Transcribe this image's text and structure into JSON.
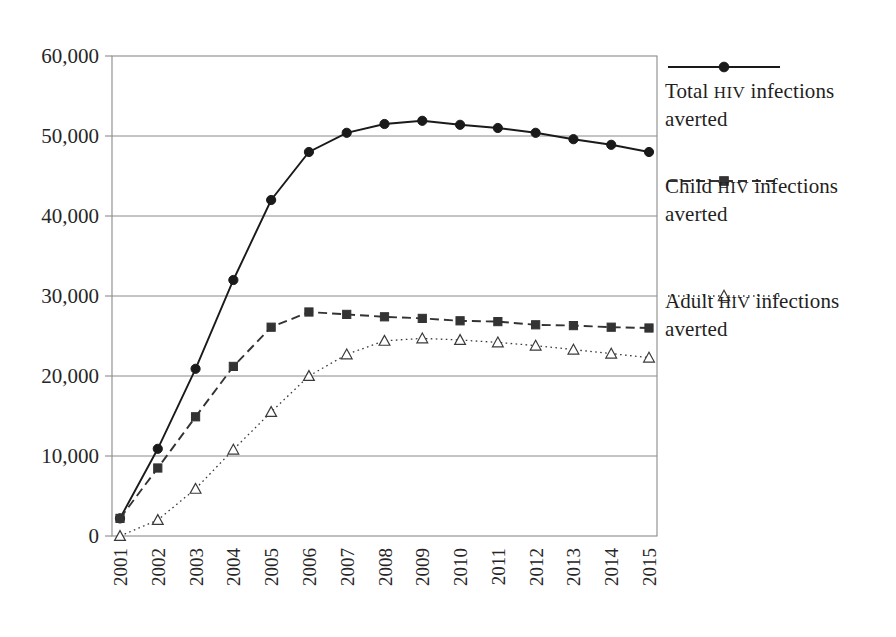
{
  "chart_data": {
    "type": "line",
    "title": "",
    "xlabel": "",
    "ylabel": "",
    "categories": [
      "2001",
      "2002",
      "2003",
      "2004",
      "2005",
      "2006",
      "2007",
      "2008",
      "2009",
      "2010",
      "2011",
      "2012",
      "2013",
      "2014",
      "2015"
    ],
    "ylim": [
      0,
      60000
    ],
    "ytick_labels": [
      "0",
      "10,000",
      "20,000",
      "30,000",
      "40,000",
      "50,000",
      "60,000"
    ],
    "ytick_values": [
      0,
      10000,
      20000,
      30000,
      40000,
      50000,
      60000
    ],
    "grid": "horizontal",
    "legend_position": "right",
    "series": [
      {
        "name": "Total HIV infections averted",
        "name_prefix": "Total",
        "name_caps": "HIV",
        "name_suffix": "infections averted",
        "marker": "filled-circle",
        "line_style": "solid",
        "color": "#1a1a1a",
        "values": [
          2200,
          10900,
          20900,
          32000,
          42000,
          48000,
          50400,
          51500,
          51900,
          51400,
          51000,
          50400,
          49600,
          48900,
          48000
        ]
      },
      {
        "name": "Child HIV infections averted",
        "name_prefix": "Child",
        "name_caps": "HIV",
        "name_suffix": "infections averted",
        "marker": "filled-square",
        "line_style": "dashed",
        "color": "#333333",
        "values": [
          2200,
          8500,
          14900,
          21200,
          26100,
          28000,
          27700,
          27400,
          27200,
          26900,
          26800,
          26400,
          26300,
          26100,
          26000
        ]
      },
      {
        "name": "Adult HIV infections averted",
        "name_prefix": "Adult",
        "name_caps": "HIV",
        "name_suffix": "infections averted",
        "marker": "open-triangle",
        "line_style": "dotted",
        "color": "#3a3a3a",
        "values": [
          0,
          2000,
          5900,
          10800,
          15500,
          20000,
          22700,
          24400,
          24700,
          24500,
          24200,
          23800,
          23300,
          22800,
          22300
        ]
      }
    ]
  },
  "axes": {
    "plot_left": 112,
    "plot_right": 657,
    "plot_top": 56,
    "plot_bottom": 536,
    "frame_color": "#8a8a8a",
    "gridline_color": "#8a8a8a"
  },
  "legend": {
    "entries": [
      {
        "key_name": "legend-key-total",
        "prefix": "Total ",
        "caps": "HIV",
        "suffix": " infections averted",
        "marker": "filled-circle",
        "line_style": "solid"
      },
      {
        "key_name": "legend-key-child",
        "prefix": "Child ",
        "caps": "HIV",
        "suffix": " infections averted",
        "marker": "filled-square",
        "line_style": "dashed"
      },
      {
        "key_name": "legend-key-adult",
        "prefix": "Adult ",
        "caps": "HIV",
        "suffix": " infections averted",
        "marker": "open-triangle",
        "line_style": "dotted"
      }
    ]
  }
}
